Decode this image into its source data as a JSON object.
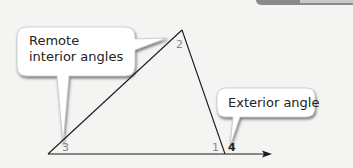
{
  "diagram": {
    "callouts": {
      "remote_interior": {
        "line1": "Remote",
        "line2": "interior angles"
      },
      "exterior": {
        "label": "Exterior angle"
      }
    },
    "angles": {
      "angle1": "1",
      "angle2": "2",
      "angle3": "3",
      "angle4": "4"
    },
    "colors": {
      "background": "#f4f4f2",
      "line": "#1a1a1a",
      "label_grey": "#888888",
      "label_dark": "#222222",
      "callout_fill": "#ffffff",
      "callout_shadow": "#9a9a9a"
    },
    "vertices": {
      "v3": [
        48,
        154
      ],
      "v2": [
        182,
        30
      ],
      "v1": [
        225,
        154
      ],
      "ray_end": [
        272,
        154
      ]
    }
  }
}
